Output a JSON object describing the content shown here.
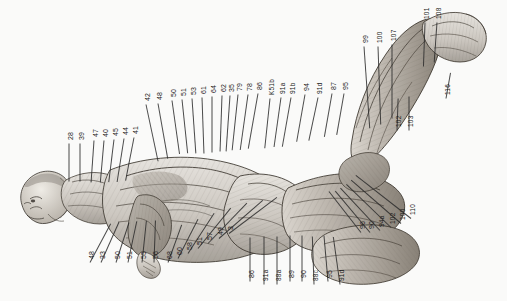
{
  "plate": {
    "title": "Anatomical plate - reclining male ecorche, posterior-lateral view",
    "orientation": "labels rotated 90 degrees counter-clockwise",
    "background_color": "#fdfdfc",
    "ink_color": "#2a2a2a"
  },
  "callouts": {
    "upper_left_column": [
      {
        "id": "c-28",
        "label": "28",
        "x": 69,
        "y": 143,
        "line_len": 38,
        "line_angle": 90
      },
      {
        "id": "c-39",
        "label": "39",
        "x": 80,
        "y": 143,
        "line_len": 38,
        "line_angle": 90
      },
      {
        "id": "c-47",
        "label": "47",
        "x": 94,
        "y": 140,
        "line_len": 42,
        "line_angle": 94
      },
      {
        "id": "c-40",
        "label": "40",
        "x": 104,
        "y": 140,
        "line_len": 42,
        "line_angle": 95
      },
      {
        "id": "c-45",
        "label": "45",
        "x": 114,
        "y": 139,
        "line_len": 43,
        "line_angle": 97
      },
      {
        "id": "c-44",
        "label": "44",
        "x": 124,
        "y": 138,
        "line_len": 44,
        "line_angle": 99
      },
      {
        "id": "c-41",
        "label": "41",
        "x": 134,
        "y": 137,
        "line_len": 44,
        "line_angle": 101
      }
    ],
    "upper_mid_column": [
      {
        "id": "c-42",
        "label": "42",
        "x": 146,
        "y": 104,
        "line_len": 58,
        "line_angle": 78
      },
      {
        "id": "c-48",
        "label": "48",
        "x": 158,
        "y": 103,
        "line_len": 56,
        "line_angle": 80
      },
      {
        "id": "c-50",
        "label": "50",
        "x": 172,
        "y": 100,
        "line_len": 54,
        "line_angle": 82
      },
      {
        "id": "c-51",
        "label": "51",
        "x": 182,
        "y": 99,
        "line_len": 54,
        "line_angle": 84
      },
      {
        "id": "c-53",
        "label": "53",
        "x": 192,
        "y": 98,
        "line_len": 55,
        "line_angle": 86
      },
      {
        "id": "c-61",
        "label": "61",
        "x": 202,
        "y": 97,
        "line_len": 56,
        "line_angle": 88
      },
      {
        "id": "c-64",
        "label": "64",
        "x": 212,
        "y": 96,
        "line_len": 56,
        "line_angle": 90
      },
      {
        "id": "c-62",
        "label": "62",
        "x": 222,
        "y": 95,
        "line_len": 56,
        "line_angle": 92
      },
      {
        "id": "c-35",
        "label": "35",
        "x": 230,
        "y": 95,
        "line_len": 56,
        "line_angle": 94
      },
      {
        "id": "c-79",
        "label": "79",
        "x": 238,
        "y": 94,
        "line_len": 56,
        "line_angle": 96
      },
      {
        "id": "c-78",
        "label": "78",
        "x": 248,
        "y": 94,
        "line_len": 56,
        "line_angle": 98
      },
      {
        "id": "c-86u",
        "label": "86",
        "x": 258,
        "y": 93,
        "line_len": 56,
        "line_angle": 100
      }
    ],
    "upper_right_column": [
      {
        "id": "c-K51b",
        "label": "K51b",
        "x": 270,
        "y": 98,
        "line_len": 50,
        "line_angle": 96
      },
      {
        "id": "c-91a",
        "label": "91a",
        "x": 281,
        "y": 97,
        "line_len": 50,
        "line_angle": 98
      },
      {
        "id": "c-91b",
        "label": "91b",
        "x": 291,
        "y": 97,
        "line_len": 50,
        "line_angle": 100
      },
      {
        "id": "c-94",
        "label": "94",
        "x": 305,
        "y": 94,
        "line_len": 48,
        "line_angle": 100
      },
      {
        "id": "c-91d",
        "label": "91d",
        "x": 318,
        "y": 97,
        "line_len": 44,
        "line_angle": 102
      },
      {
        "id": "c-87",
        "label": "87",
        "x": 332,
        "y": 93,
        "line_len": 44,
        "line_angle": 100
      },
      {
        "id": "c-95",
        "label": "95",
        "x": 344,
        "y": 93,
        "line_len": 42,
        "line_angle": 100
      }
    ],
    "leg_top_column": [
      {
        "id": "c-99",
        "label": "99",
        "x": 364,
        "y": 46,
        "line_len": 82,
        "line_angle": 86
      },
      {
        "id": "c-100",
        "label": "100",
        "x": 378,
        "y": 46,
        "line_len": 78,
        "line_angle": 88
      },
      {
        "id": "c-107",
        "label": "107",
        "x": 392,
        "y": 44,
        "line_len": 74,
        "line_angle": 90
      },
      {
        "id": "c-101",
        "label": "101",
        "x": 425,
        "y": 22,
        "line_len": 44,
        "line_angle": 92
      },
      {
        "id": "c-108",
        "label": "108",
        "x": 437,
        "y": 22,
        "line_len": 40,
        "line_angle": 94
      }
    ],
    "leg_mid_column": [
      {
        "id": "c-116",
        "label": "116",
        "x": 446,
        "y": 98,
        "line_len": 26,
        "line_angle": -80
      },
      {
        "id": "c-102",
        "label": "102",
        "x": 397,
        "y": 130,
        "line_len": 32,
        "line_angle": -88
      },
      {
        "id": "c-103",
        "label": "103",
        "x": 409,
        "y": 130,
        "line_len": 34,
        "line_angle": -90
      }
    ],
    "lower_right_column": [
      {
        "id": "c-96",
        "label": "96",
        "x": 361,
        "y": 232,
        "line_len": 52,
        "line_angle": -128
      },
      {
        "id": "c-90r",
        "label": "90",
        "x": 370,
        "y": 232,
        "line_len": 54,
        "line_angle": -130
      },
      {
        "id": "c-94a",
        "label": "94a",
        "x": 380,
        "y": 230,
        "line_len": 58,
        "line_angle": -133
      },
      {
        "id": "c-102b",
        "label": "102",
        "x": 391,
        "y": 227,
        "line_len": 62,
        "line_angle": -136
      },
      {
        "id": "c-100b",
        "label": "100",
        "x": 401,
        "y": 223,
        "line_len": 66,
        "line_angle": -139
      },
      {
        "id": "c-110",
        "label": "110",
        "x": 411,
        "y": 218,
        "line_len": 70,
        "line_angle": -142
      }
    ],
    "lower_mid_column": [
      {
        "id": "c-86b",
        "label": "86",
        "x": 250,
        "y": 281,
        "line_len": 44,
        "line_angle": -90
      },
      {
        "id": "c-91a2",
        "label": "91a",
        "x": 264,
        "y": 284,
        "line_len": 48,
        "line_angle": -90
      },
      {
        "id": "c-88a",
        "label": "88a",
        "x": 277,
        "y": 284,
        "line_len": 48,
        "line_angle": -90
      },
      {
        "id": "c-89",
        "label": "89",
        "x": 290,
        "y": 281,
        "line_len": 46,
        "line_angle": -90
      },
      {
        "id": "c-90",
        "label": "90",
        "x": 302,
        "y": 281,
        "line_len": 46,
        "line_angle": -90
      },
      {
        "id": "c-88c",
        "label": "88c",
        "x": 314,
        "y": 284,
        "line_len": 48,
        "line_angle": -92
      },
      {
        "id": "c-95b",
        "label": "95",
        "x": 328,
        "y": 281,
        "line_len": 46,
        "line_angle": -95
      },
      {
        "id": "c-91d2",
        "label": "91d",
        "x": 340,
        "y": 284,
        "line_len": 48,
        "line_angle": -98
      }
    ],
    "lower_left_column": [
      {
        "id": "c-48b",
        "label": "48",
        "x": 90,
        "y": 262,
        "line_len": 44,
        "line_angle": -62
      },
      {
        "id": "c-33",
        "label": "33",
        "x": 101,
        "y": 262,
        "line_len": 44,
        "line_angle": -66
      },
      {
        "id": "c-50b",
        "label": "50",
        "x": 116,
        "y": 262,
        "line_len": 42,
        "line_angle": -72
      },
      {
        "id": "c-51b",
        "label": "51",
        "x": 128,
        "y": 262,
        "line_len": 42,
        "line_angle": -78
      },
      {
        "id": "c-55",
        "label": "55",
        "x": 142,
        "y": 262,
        "line_len": 42,
        "line_angle": -84
      },
      {
        "id": "c-56",
        "label": "56",
        "x": 154,
        "y": 262,
        "line_len": 42,
        "line_angle": -88
      }
    ],
    "lower_center_column": [
      {
        "id": "c-68",
        "label": "68",
        "x": 168,
        "y": 262,
        "line_len": 40,
        "line_angle": -70
      },
      {
        "id": "c-60",
        "label": "60",
        "x": 178,
        "y": 258,
        "line_len": 44,
        "line_angle": -63
      },
      {
        "id": "c-58",
        "label": "58",
        "x": 188,
        "y": 253,
        "line_len": 48,
        "line_angle": -57
      },
      {
        "id": "c-51c",
        "label": "51",
        "x": 198,
        "y": 248,
        "line_len": 52,
        "line_angle": -51
      },
      {
        "id": "c-57",
        "label": "57",
        "x": 208,
        "y": 243,
        "line_len": 56,
        "line_angle": -46
      },
      {
        "id": "c-49",
        "label": "49",
        "x": 219,
        "y": 238,
        "line_len": 58,
        "line_angle": -41
      },
      {
        "id": "c-3",
        "label": "3",
        "x": 229,
        "y": 233,
        "line_len": 60,
        "line_angle": -37
      }
    ]
  }
}
